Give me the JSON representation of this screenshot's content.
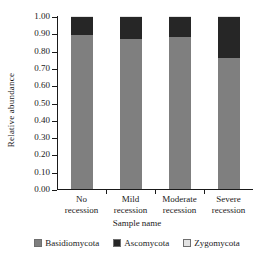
{
  "chart_data": {
    "type": "bar",
    "stacked": true,
    "normalized": true,
    "title": "",
    "xlabel": "Sample name",
    "ylabel": "Relative abundance",
    "categories": [
      "No recession",
      "Mild recession",
      "Moderate recession",
      "Severe recession"
    ],
    "category_lines": [
      [
        "No",
        "recession"
      ],
      [
        "Mild",
        "recession"
      ],
      [
        "Moderate",
        "recession"
      ],
      [
        "Severe",
        "recession"
      ]
    ],
    "series": [
      {
        "name": "Basidiomycota",
        "color": "#7f7f7f",
        "values": [
          0.89,
          0.865,
          0.88,
          0.76
        ]
      },
      {
        "name": "Ascomycota",
        "color": "#262626",
        "values": [
          0.105,
          0.13,
          0.115,
          0.235
        ]
      },
      {
        "name": "Zygomycota",
        "color": "#e3e3e3",
        "values": [
          0.005,
          0.005,
          0.005,
          0.005
        ]
      }
    ],
    "ylim": [
      0.0,
      1.0
    ],
    "ytick_values": [
      0.0,
      0.1,
      0.2,
      0.3,
      0.4,
      0.5,
      0.6,
      0.7,
      0.8,
      0.9,
      1.0
    ],
    "ytick_labels": [
      "0.00",
      "0.10",
      "0.20",
      "0.30",
      "0.40",
      "0.50",
      "0.60",
      "0.70",
      "0.80",
      "0.90",
      "1.00"
    ],
    "grid": false,
    "legend_position": "bottom",
    "legend_entries": [
      "Basidiomycota",
      "Ascomycota",
      "Zygomycota"
    ]
  },
  "axes": {
    "y_title": "Relative abundance",
    "x_title": "Sample name"
  }
}
